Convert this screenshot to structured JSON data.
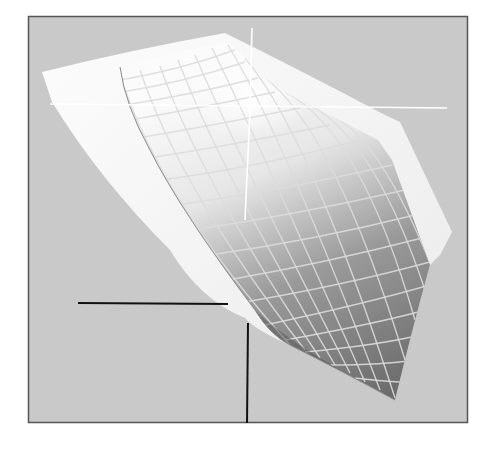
{
  "figure": {
    "colors": {
      "page_background": "#ffffff",
      "frame_fill": "#c9c9c9",
      "frame_border": "#555555",
      "outer_shell": "#f4f4f4",
      "inner_surface_light": "#f0f0f0",
      "inner_surface_dark": "#6e6e6e",
      "grid_lines": "#d8d8d8",
      "crosshair": "#ffffff",
      "leader_lines": "#111111"
    },
    "frame": {
      "x": 28,
      "y": 16,
      "width": 440,
      "height": 407
    },
    "crosshair": {
      "horizontal": {
        "x1": 50,
        "y1": 104,
        "x2": 447,
        "y2": 108
      },
      "vertical_top": {
        "x1": 252,
        "y1": 28,
        "x2": 250,
        "y2": 110
      },
      "vertical_bottom": {
        "x1": 250,
        "y1": 110,
        "x2": 245,
        "y2": 220
      }
    },
    "leader_lines": {
      "horizontal": {
        "x1": 78,
        "y1": 303,
        "x2": 228,
        "y2": 304
      },
      "vertical": {
        "x1": 248,
        "y1": 323,
        "x2": 247,
        "y2": 423
      }
    }
  }
}
